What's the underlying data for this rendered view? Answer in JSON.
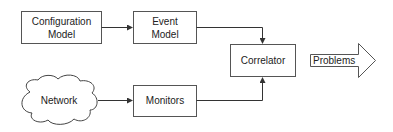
{
  "diagram": {
    "nodes": {
      "config": {
        "line1": "Configuration",
        "line2": "Model"
      },
      "event": {
        "line1": "Event",
        "line2": "Model"
      },
      "correlator": {
        "label": "Correlator"
      },
      "network": {
        "label": "Network"
      },
      "monitors": {
        "label": "Monitors"
      },
      "problems": {
        "label": "Problems"
      }
    },
    "edges": [
      {
        "from": "Configuration Model",
        "to": "Event Model"
      },
      {
        "from": "Event Model",
        "to": "Correlator"
      },
      {
        "from": "Network",
        "to": "Monitors"
      },
      {
        "from": "Monitors",
        "to": "Correlator"
      },
      {
        "from": "Correlator",
        "to": "Problems"
      }
    ],
    "colors": {
      "stroke": "#555555",
      "text": "#222222",
      "background": "#ffffff"
    }
  }
}
